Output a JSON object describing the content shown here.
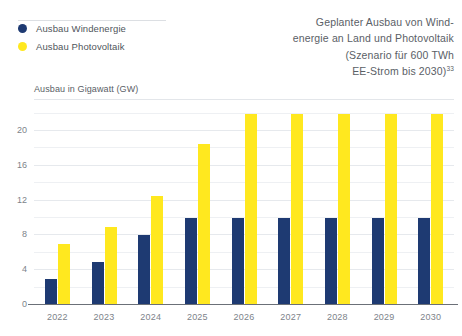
{
  "legend": {
    "items": [
      {
        "label": "Ausbau Windenergie",
        "color": "#1e3a72",
        "icon": "legend-dot-wind"
      },
      {
        "label": "Ausbau Photovoltaik",
        "color": "#ffe81f",
        "icon": "legend-dot-pv"
      }
    ]
  },
  "title": {
    "line1": "Geplanter Ausbau von Wind-",
    "line2": "energie an Land und Photovoltaik",
    "line3": "(Szenario für 600 TWh",
    "line4": "EE-Strom bis 2030)",
    "footnote": "33"
  },
  "axis_title": "Ausbau in Gigawatt (GW)",
  "chart_data": {
    "type": "bar",
    "xlabel": "",
    "ylabel": "Ausbau in Gigawatt (GW)",
    "ylim": [
      0,
      23
    ],
    "yticks": [
      0,
      4,
      8,
      12,
      16,
      20
    ],
    "yticklabels": [
      "0",
      "4",
      "8",
      "12",
      "16",
      "20"
    ],
    "minor_gridlines": [
      2,
      6,
      10,
      14,
      18,
      22
    ],
    "grid": true,
    "legend_position": "top-left",
    "categories": [
      "2022",
      "2023",
      "2024",
      "2025",
      "2026",
      "2027",
      "2028",
      "2029",
      "2030"
    ],
    "series": [
      {
        "name": "Ausbau Windenergie",
        "color": "#1e3a72",
        "values": [
          3,
          5,
          8,
          10,
          10,
          10,
          10,
          10,
          10
        ]
      },
      {
        "name": "Ausbau Photovoltaik",
        "color": "#ffe81f",
        "values": [
          7,
          9,
          12.5,
          18.5,
          22,
          22,
          22,
          22,
          22
        ]
      }
    ]
  },
  "colors": {
    "wind": "#1e3a72",
    "pv": "#ffe81f",
    "text": "#5a6066",
    "tick": "#7d838a",
    "grid": "#e6e9ed",
    "baseline": "#6b7078"
  }
}
